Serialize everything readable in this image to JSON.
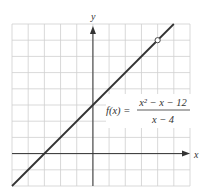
{
  "chart_data": {
    "type": "line",
    "title": "",
    "xlabel": "x",
    "ylabel": "y",
    "xlim": [
      -5,
      6
    ],
    "ylim": [
      -2,
      8
    ],
    "grid": true,
    "grid_step": 1,
    "series": [
      {
        "name": "f(x) = (x^2 - x - 12)/(x - 4)",
        "equivalent": "y = x + 3, x ≠ 4",
        "x": [
          -5,
          5
        ],
        "y": [
          -2,
          8
        ]
      }
    ],
    "points": [
      {
        "x": 4,
        "y": 7,
        "kind": "hole",
        "label": "open circle"
      }
    ],
    "annotation": {
      "lhs": "f(x) =",
      "numerator": "x² − x − 12",
      "denominator": "x − 4"
    }
  }
}
